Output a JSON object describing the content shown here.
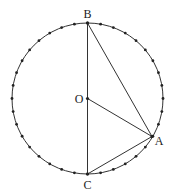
{
  "figure": {
    "top_fragment": "A",
    "circle": {
      "cx": 87.5,
      "cy": 98.5,
      "r": 75.5,
      "dot_count": 36,
      "dot_radius": 1.4,
      "stroke": "#333333"
    },
    "points": {
      "B": {
        "label": "B",
        "x": 87.5,
        "y": 23,
        "lx": 87.5,
        "ly": 18
      },
      "C": {
        "label": "C",
        "x": 87.5,
        "y": 174,
        "lx": 87.5,
        "ly": 189
      },
      "O": {
        "label": "O",
        "x": 87.5,
        "y": 98.5,
        "lx": 79,
        "ly": 103
      },
      "A": {
        "label": "A",
        "x": 152,
        "y": 136.5,
        "lx": 159,
        "ly": 145
      }
    },
    "segments": [
      [
        "B",
        "C"
      ],
      [
        "B",
        "A"
      ],
      [
        "O",
        "A"
      ],
      [
        "C",
        "A"
      ]
    ],
    "line_color": "#333333"
  }
}
